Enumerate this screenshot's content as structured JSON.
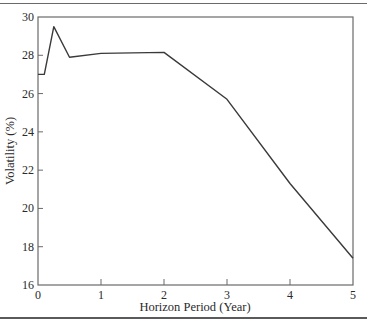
{
  "chart_data": {
    "type": "line",
    "title": "",
    "xlabel": "Horizon Period (Year)",
    "ylabel": "Volatility (%)",
    "xlim": [
      0,
      5
    ],
    "ylim": [
      16,
      30
    ],
    "xticks": [
      "0",
      "1",
      "2",
      "3",
      "4",
      "5"
    ],
    "yticks": [
      "16",
      "18",
      "20",
      "22",
      "24",
      "26",
      "28",
      "30"
    ],
    "grid": false,
    "legend": null,
    "series": [
      {
        "name": "Volatility",
        "x": [
          0,
          0.1,
          0.25,
          0.5,
          1,
          2,
          3,
          4,
          5
        ],
        "values": [
          27.0,
          27.0,
          29.5,
          27.9,
          28.1,
          28.15,
          25.7,
          21.3,
          17.4
        ]
      }
    ]
  },
  "colors": {
    "line": "#3a3a3a",
    "axis": "#6a6a6a"
  }
}
